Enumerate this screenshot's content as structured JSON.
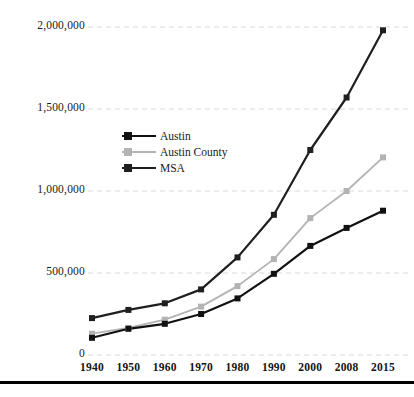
{
  "chart_data": {
    "type": "line",
    "title": "",
    "xlabel": "",
    "ylabel": "",
    "categories": [
      "1940",
      "1950",
      "1960",
      "1970",
      "1980",
      "1990",
      "2000",
      "2008",
      "2015"
    ],
    "x_tick_labels": [
      "1940",
      "1950",
      "1960",
      "1970",
      "1980",
      "1990",
      "2000",
      "2008",
      "2015"
    ],
    "y_tick_labels": [
      "0",
      "500,000",
      "1,000,000",
      "1,500,000",
      "2,000,000"
    ],
    "y_ticks": [
      0,
      500000,
      1000000,
      1500000,
      2000000
    ],
    "ylim": [
      0,
      2000000
    ],
    "grid": "horizontal-dashed",
    "legend_position": "inside-upper-left",
    "series": [
      {
        "name": "Austin",
        "color": "#111111",
        "marker": "square",
        "values": [
          105000,
          160000,
          190000,
          250000,
          345000,
          495000,
          665000,
          775000,
          880000
        ]
      },
      {
        "name": "Austin County",
        "color": "#b3b3b3",
        "marker": "square",
        "values": [
          130000,
          165000,
          215000,
          295000,
          420000,
          585000,
          835000,
          1000000,
          1205000
        ]
      },
      {
        "name": "MSA",
        "color": "#1f1f1f",
        "marker": "square",
        "values": [
          225000,
          275000,
          315000,
          400000,
          595000,
          855000,
          1250000,
          1570000,
          1980000
        ]
      }
    ]
  },
  "legend": {
    "items": [
      {
        "label": "Austin"
      },
      {
        "label": "Austin County"
      },
      {
        "label": "MSA"
      }
    ]
  },
  "colors": {
    "austin": "#111111",
    "austin_county": "#b3b3b3",
    "msa": "#1f1f1f",
    "gridline": "#d8d8d8",
    "background": "#ffffff",
    "rule": "#000000"
  }
}
